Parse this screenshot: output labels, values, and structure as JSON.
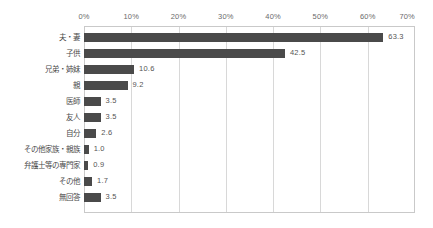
{
  "chart_data": {
    "type": "bar",
    "orientation": "horizontal",
    "title": "",
    "subtitle": "",
    "xlabel": "",
    "ylabel": "",
    "xlim": [
      0,
      70
    ],
    "xticks": [
      0,
      10,
      20,
      30,
      40,
      50,
      60,
      70
    ],
    "xtick_labels": [
      "0%",
      "10%",
      "20%",
      "30%",
      "40%",
      "50%",
      "60%",
      "70%"
    ],
    "grid": true,
    "grid_axis": "x",
    "legend": false,
    "legend_position": "none",
    "bar_color": "#4a4a4a",
    "gridline_color": "#d8d8d8",
    "border_color": "#c9c9c9",
    "label_color": "#555555",
    "axis_label_color": "#6b6b6b",
    "categories": [
      "夫・妻",
      "子供",
      "兄弟・姉妹",
      "親",
      "医師",
      "友人",
      "自分",
      "その他家族・親族",
      "弁護士等の専門家",
      "その他",
      "無回答"
    ],
    "values": [
      63.3,
      42.5,
      10.6,
      9.2,
      3.5,
      3.5,
      2.6,
      1.0,
      0.9,
      1.7,
      3.5
    ],
    "value_labels": [
      "63.3",
      "42.5",
      "10.6",
      "9.2",
      "3.5",
      "3.5",
      "2.6",
      "1.0",
      "0.9",
      "1.7",
      "3.5"
    ]
  }
}
